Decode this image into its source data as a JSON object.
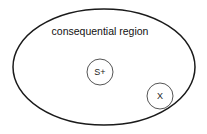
{
  "canvas": {
    "width": 207,
    "height": 134,
    "background": "#ffffff"
  },
  "diagram": {
    "type": "venn-region",
    "title": "consequential region",
    "stroke_color": "#1a1a1a",
    "node_stroke_color": "#555555",
    "text_color": "#111111"
  },
  "region": {
    "label": "consequential region",
    "label_x": 100,
    "label_y": 32,
    "shape": "ellipse",
    "cx": 104,
    "cy": 67,
    "rx": 91,
    "ry": 58
  },
  "nodes": [
    {
      "label": "S+",
      "name": "node-s-plus",
      "cx": 100,
      "cy": 72,
      "r": 13
    },
    {
      "label": "X",
      "name": "node-x",
      "cx": 160,
      "cy": 96,
      "r": 13
    }
  ]
}
